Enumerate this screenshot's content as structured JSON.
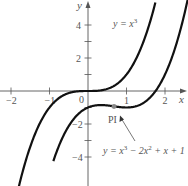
{
  "chart_data": {
    "type": "line",
    "title": "",
    "xlabel": "x",
    "ylabel": "y",
    "xlim": [
      -2.2,
      2.5
    ],
    "ylim": [
      -5.5,
      5.5
    ],
    "grid": false,
    "x_ticks": [
      -2,
      -1,
      1,
      2
    ],
    "x_tick_labels": [
      "−2",
      "−1",
      "1",
      "2"
    ],
    "y_ticks": [
      4,
      3,
      2,
      1,
      -1,
      -2,
      -3,
      -4
    ],
    "y_tick_labels": [
      {
        "value": 4,
        "label": "4"
      },
      {
        "value": 2,
        "label": "2"
      },
      {
        "value": -2,
        "label": "−2"
      },
      {
        "value": -4,
        "label": "−4"
      }
    ],
    "origin_label": "0",
    "series": [
      {
        "name": "y = x³",
        "expression": "x^3",
        "color": "#111111"
      },
      {
        "name": "y = x³ − 2x² + x + 1",
        "expression": "x^3 - 2x^2 + x - 1",
        "color": "#111111"
      }
    ],
    "annotations": [
      {
        "text": "y = x³",
        "position": "upper curve label"
      },
      {
        "text": "PI",
        "point": [
          0.667,
          -0.93
        ],
        "note": "point of inflection"
      },
      {
        "text": "y = x³ − 2x² +  x + 1",
        "arrow_to": [
          0.8,
          -1.0
        ]
      }
    ]
  },
  "labels": {
    "axis_x": "x",
    "axis_y": "y",
    "origin": "0",
    "curve1": "y = x",
    "curve1_exp": "3",
    "pi": "PI",
    "curve2_a": "y = x",
    "curve2_exp1": "3",
    "curve2_b": " − 2x",
    "curve2_exp2": "2",
    "curve2_c": " +  x + 1"
  }
}
